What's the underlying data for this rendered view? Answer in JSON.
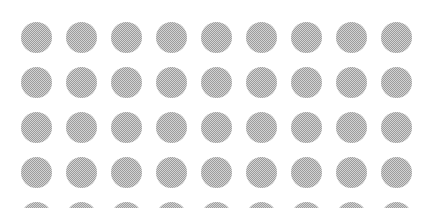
{
  "canvas": {
    "width": 428,
    "height": 208,
    "background_color": "#ffffff"
  },
  "pattern": {
    "name": "halftone-dot-grid",
    "shape": "circle",
    "fill_color": "#9a9a9a",
    "texture": "dithered-checkerboard",
    "columns": 9,
    "rows_visible": 5,
    "rows_full": 4,
    "rows_clipped": 1,
    "dot_diameter": 31,
    "column_pitch": 45,
    "row_pitch": 45,
    "origin_x": 21,
    "origin_y": 22,
    "margin_top": 22,
    "margin_left": 21,
    "margin_right": 13,
    "total_dots_visible": 45
  },
  "chart_data": {
    "type": "heatmap",
    "title": "",
    "xlabel": "",
    "ylabel": "",
    "columns": [
      1,
      2,
      3,
      4,
      5,
      6,
      7,
      8,
      9
    ],
    "rows": [
      1,
      2,
      3,
      4,
      5
    ],
    "values": [
      [
        1,
        1,
        1,
        1,
        1,
        1,
        1,
        1,
        1
      ],
      [
        1,
        1,
        1,
        1,
        1,
        1,
        1,
        1,
        1
      ],
      [
        1,
        1,
        1,
        1,
        1,
        1,
        1,
        1,
        1
      ],
      [
        1,
        1,
        1,
        1,
        1,
        1,
        1,
        1,
        1
      ],
      [
        1,
        1,
        1,
        1,
        1,
        1,
        1,
        1,
        1
      ]
    ],
    "column_centers_px": [
      36,
      81,
      126,
      171,
      216,
      261,
      306,
      351,
      396
    ],
    "row_centers_px": [
      37,
      82,
      127,
      172,
      217
    ],
    "grid": false,
    "legend": "none"
  }
}
